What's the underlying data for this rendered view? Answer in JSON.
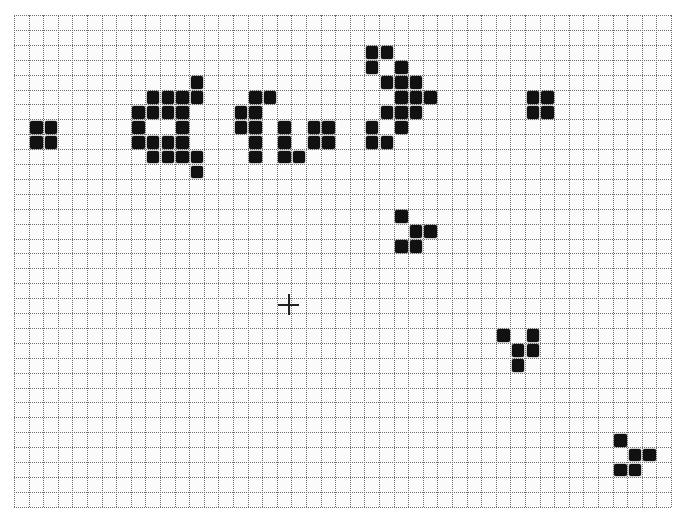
{
  "game": {
    "name": "Conway's Game of Life",
    "grid": {
      "columns": 45,
      "rows": 33,
      "origin_x": 14,
      "origin_y": 15,
      "cell_width": 14.6,
      "cell_height": 14.9,
      "line_color": "#6e6e6e",
      "background_color": "#fbfbfb",
      "live_cell_color": "#111111"
    },
    "patterns": [
      {
        "name": "block-left",
        "cells": [
          [
            1,
            7
          ],
          [
            2,
            7
          ],
          [
            1,
            8
          ],
          [
            2,
            8
          ]
        ]
      },
      {
        "name": "gun-left-part",
        "cells": [
          [
            12,
            4
          ],
          [
            9,
            5
          ],
          [
            10,
            5
          ],
          [
            11,
            5
          ],
          [
            12,
            5
          ],
          [
            8,
            6
          ],
          [
            9,
            6
          ],
          [
            10,
            6
          ],
          [
            11,
            6
          ],
          [
            8,
            7
          ],
          [
            11,
            7
          ],
          [
            8,
            8
          ],
          [
            9,
            8
          ],
          [
            10,
            8
          ],
          [
            11,
            8
          ],
          [
            9,
            9
          ],
          [
            10,
            9
          ],
          [
            11,
            9
          ],
          [
            12,
            9
          ],
          [
            12,
            10
          ]
        ]
      },
      {
        "name": "gun-middle-part",
        "cells": [
          [
            16,
            5
          ],
          [
            17,
            5
          ],
          [
            15,
            6
          ],
          [
            16,
            6
          ],
          [
            15,
            7
          ],
          [
            16,
            7
          ],
          [
            18,
            7
          ],
          [
            20,
            7
          ],
          [
            21,
            7
          ],
          [
            16,
            8
          ],
          [
            18,
            8
          ],
          [
            20,
            8
          ],
          [
            21,
            8
          ],
          [
            16,
            9
          ],
          [
            18,
            9
          ],
          [
            19,
            9
          ]
        ]
      },
      {
        "name": "gun-right-part",
        "cells": [
          [
            24,
            2
          ],
          [
            25,
            2
          ],
          [
            24,
            3
          ],
          [
            26,
            3
          ],
          [
            25,
            4
          ],
          [
            26,
            4
          ],
          [
            27,
            4
          ],
          [
            26,
            5
          ],
          [
            27,
            5
          ],
          [
            28,
            5
          ],
          [
            25,
            6
          ],
          [
            26,
            6
          ],
          [
            27,
            6
          ],
          [
            24,
            7
          ],
          [
            26,
            7
          ],
          [
            24,
            8
          ],
          [
            25,
            8
          ]
        ]
      },
      {
        "name": "block-right",
        "cells": [
          [
            35,
            5
          ],
          [
            36,
            5
          ],
          [
            35,
            6
          ],
          [
            36,
            6
          ]
        ]
      },
      {
        "name": "glider-1",
        "cells": [
          [
            26,
            13
          ],
          [
            27,
            14
          ],
          [
            28,
            14
          ],
          [
            26,
            15
          ],
          [
            27,
            15
          ]
        ]
      },
      {
        "name": "glider-2",
        "cells": [
          [
            33,
            21
          ],
          [
            35,
            21
          ],
          [
            34,
            22
          ],
          [
            35,
            22
          ],
          [
            34,
            23
          ]
        ]
      },
      {
        "name": "glider-3",
        "cells": [
          [
            41,
            28
          ],
          [
            42,
            29
          ],
          [
            43,
            29
          ],
          [
            41,
            30
          ],
          [
            42,
            30
          ]
        ]
      }
    ],
    "cursor": {
      "icon": "crosshair-icon",
      "x": 288,
      "y": 304
    }
  }
}
